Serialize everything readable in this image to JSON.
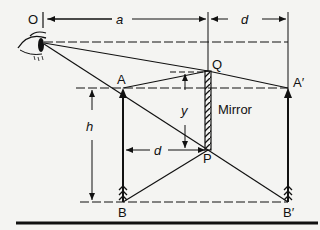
{
  "diagram": {
    "labels": {
      "observer": "O",
      "distance_a": "a",
      "distance_d_top": "d",
      "distance_d_mid": "d",
      "height_h": "h",
      "segment_y": "y",
      "mirror": "Mirror",
      "point_A": "A",
      "point_A_image": "A′",
      "point_B": "B",
      "point_B_image": "B′",
      "point_Q": "Q",
      "point_P": "P"
    },
    "colors": {
      "line": "#111111",
      "background": "#f4f4f2"
    }
  }
}
